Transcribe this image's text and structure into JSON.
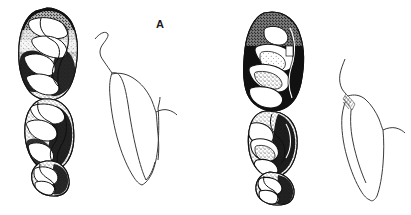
{
  "figure": {
    "type": "scientific-illustration",
    "background_color": "#ffffff",
    "ink_color": "#111111",
    "width": 411,
    "height": 215,
    "panels": [
      {
        "id": "A",
        "label": "A",
        "label_position": {
          "x": 156,
          "y": 19
        },
        "occlusal_view": {
          "name": "occlusal-view-a",
          "description": "stippled and inked crown view of three cheek teeth in a row",
          "tooth_count": 3,
          "bounds": {
            "x": 18,
            "y": 8,
            "width": 62,
            "height": 187
          },
          "teeth": [
            {
              "name": "tooth-a-1",
              "position": "anterior",
              "relative_size": "large"
            },
            {
              "name": "tooth-a-2",
              "position": "middle",
              "relative_size": "large"
            },
            {
              "name": "tooth-a-3",
              "position": "posterior",
              "relative_size": "small"
            }
          ]
        },
        "lateral_view": {
          "name": "lateral-view-a",
          "description": "outline profile drawing of the tooth in side view",
          "bounds": {
            "x": 92,
            "y": 28,
            "width": 82,
            "height": 157
          }
        }
      },
      {
        "id": "B",
        "label": "B",
        "label_position": {
          "x": 378,
          "y": 26
        },
        "occlusal_view": {
          "name": "occlusal-view-b",
          "description": "stippled and inked crown view of three cheek teeth in a row, heavier shading",
          "tooth_count": 3,
          "bounds": {
            "x": 243,
            "y": 12,
            "width": 62,
            "height": 193
          },
          "teeth": [
            {
              "name": "tooth-b-1",
              "position": "anterior",
              "relative_size": "large"
            },
            {
              "name": "tooth-b-2",
              "position": "middle",
              "relative_size": "medium"
            },
            {
              "name": "tooth-b-3",
              "position": "posterior",
              "relative_size": "small"
            }
          ]
        },
        "lateral_view": {
          "name": "lateral-view-b",
          "description": "outline profile drawing of the tooth in side view with hatching at the cervix",
          "bounds": {
            "x": 330,
            "y": 48,
            "width": 78,
            "height": 150
          }
        }
      }
    ]
  }
}
